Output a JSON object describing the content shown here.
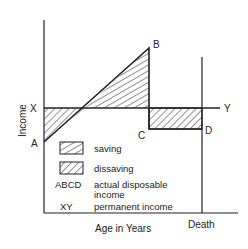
{
  "diagram": {
    "type": "permanent income hypothesis diagram",
    "axes": {
      "ylabel": "Income",
      "xlabel": "Age in Years",
      "x_end_label": "Death"
    },
    "points": {
      "X": "X",
      "Y": "Y",
      "A": "A",
      "B": "B",
      "C": "C",
      "D": "D"
    },
    "legend": {
      "saving": "saving",
      "dissaving": "dissaving",
      "abcd_key": "ABCD",
      "abcd_desc_1": "actual disposable",
      "abcd_desc_2": "income",
      "xy_key": "XY",
      "xy_desc": "permanent income"
    },
    "colors": {
      "ink": "#222222",
      "background": "#ffffff"
    }
  }
}
